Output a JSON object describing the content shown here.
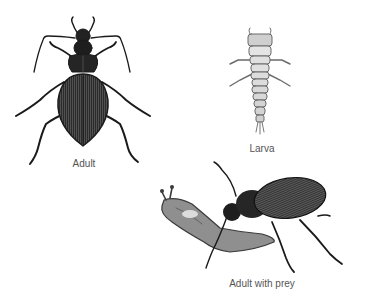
{
  "figures": [
    {
      "id": "adult",
      "label": "Adult"
    },
    {
      "id": "larva",
      "label": "Larva"
    },
    {
      "id": "adult-with-prey",
      "label": "Adult with prey"
    }
  ],
  "colors": {
    "background": "#ffffff",
    "label": "#555555",
    "ink": "#1a1a1a",
    "body_dark": "#2a2a2a",
    "larva": "#9a9a9a",
    "prey": "#8a8a8a"
  }
}
